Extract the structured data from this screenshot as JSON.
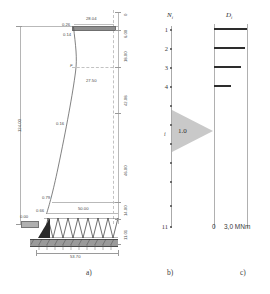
{
  "figure": {
    "subfigures": [
      {
        "key": "a",
        "label": "a)"
      },
      {
        "key": "b",
        "label": "b)"
      },
      {
        "key": "c",
        "label": "c)"
      }
    ]
  },
  "panel_a": {
    "name": "tower-deflection-diagram",
    "total_height_label": "124.00",
    "base_width_label": "53.70",
    "top_beam_label": "28.04",
    "mid_span_label": "27.50",
    "lower_span_label": "50.00",
    "force_marker": "F",
    "deflection_labels": [
      {
        "value": "0.26",
        "at": "top-beam-upper"
      },
      {
        "value": "0.14",
        "at": "top-beam-lower"
      },
      {
        "value": "0.16",
        "at": "mid-curve"
      },
      {
        "value": "0.79",
        "at": "lower-curve"
      },
      {
        "value": "0.66",
        "at": "near-base"
      },
      {
        "value": "0.00",
        "at": "support"
      }
    ],
    "right_dimensions": [
      {
        "value": "0",
        "pos": "top"
      },
      {
        "value": "6.00",
        "pos": "beam-depth"
      },
      {
        "value": "18.00",
        "pos": "upper-segment"
      },
      {
        "value": "42.08",
        "pos": "middle-segment"
      },
      {
        "value": "46.00",
        "pos": "lower-segment"
      },
      {
        "value": "14.00",
        "pos": "base-segment"
      },
      {
        "value": "11.01",
        "pos": "foundation"
      }
    ]
  },
  "panel_b": {
    "name": "node-numbering-column",
    "header": "N",
    "header_sub": "i",
    "nodes": [
      {
        "num": "1"
      },
      {
        "num": "2"
      },
      {
        "num": "3"
      },
      {
        "num": "4"
      },
      {
        "num": "11"
      }
    ],
    "load_marker": "i",
    "load_value": "1.0"
  },
  "panel_c": {
    "name": "moment-bar-chart",
    "header": "D",
    "header_sub": "i",
    "axis_zero": "0",
    "axis_max": "3,0 MNm",
    "unit": "MNm"
  },
  "chart_data": {
    "type": "bar",
    "orientation": "horizontal",
    "categories": [
      "1",
      "2",
      "3",
      "4"
    ],
    "values": [
      3.0,
      2.85,
      2.45,
      1.55
    ],
    "xlabel": "MNm",
    "ylabel": "",
    "xlim": [
      0,
      3.0
    ],
    "xticks": [
      0,
      3.0
    ],
    "xticklabels": [
      "0",
      "3,0 MNm"
    ],
    "grid": false,
    "legend": false
  }
}
